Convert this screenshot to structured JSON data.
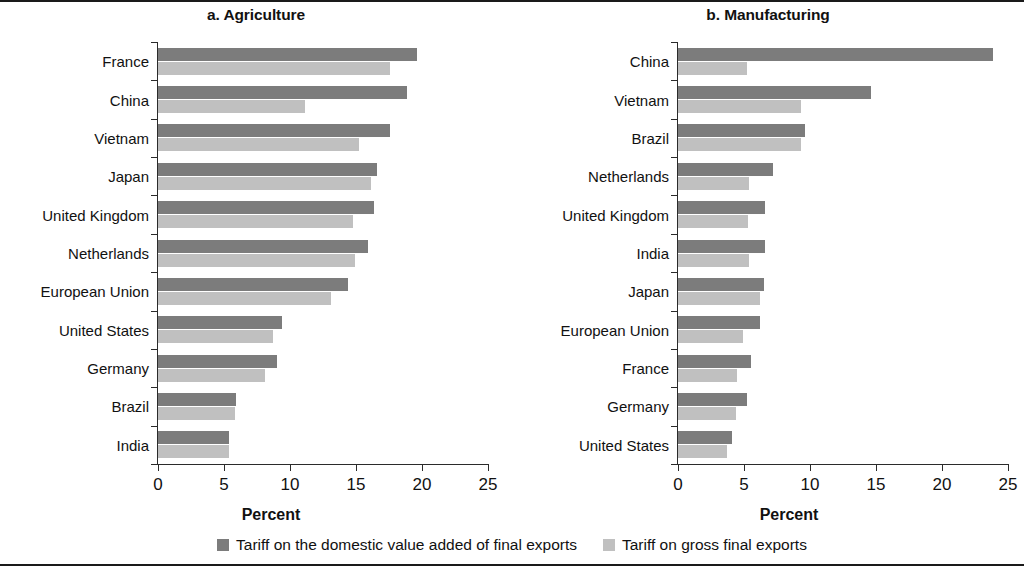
{
  "legend": {
    "items": [
      {
        "label": "Tariff on the domestic value added of final exports",
        "color": "#7c7c7c",
        "key": "dark"
      },
      {
        "label": "Tariff on gross final exports",
        "color": "#c0c0c0",
        "key": "light"
      }
    ]
  },
  "chart_data": [
    {
      "type": "bar",
      "orientation": "horizontal",
      "title": "a. Agriculture",
      "xlabel": "Percent",
      "ylabel": "",
      "xlim": [
        0,
        25
      ],
      "xticks": [
        0,
        5,
        10,
        15,
        20,
        25
      ],
      "grid": false,
      "legend_position": "bottom-center",
      "categories": [
        "France",
        "China",
        "Vietnam",
        "Japan",
        "United Kingdom",
        "Netherlands",
        "European Union",
        "United States",
        "Germany",
        "Brazil",
        "India"
      ],
      "series": [
        {
          "name": "Tariff on the domestic value added of final exports",
          "color": "#7c7c7c",
          "values": [
            19.6,
            18.9,
            17.6,
            16.6,
            16.4,
            15.9,
            14.4,
            9.4,
            9.0,
            5.9,
            5.4
          ]
        },
        {
          "name": "Tariff on gross final exports",
          "color": "#c0c0c0",
          "values": [
            17.6,
            11.1,
            15.2,
            16.1,
            14.8,
            14.9,
            13.1,
            8.7,
            8.1,
            5.8,
            5.4
          ]
        }
      ]
    },
    {
      "type": "bar",
      "orientation": "horizontal",
      "title": "b. Manufacturing",
      "xlabel": "Percent",
      "ylabel": "",
      "xlim": [
        0,
        25
      ],
      "xticks": [
        0,
        5,
        10,
        15,
        20,
        25
      ],
      "grid": false,
      "legend_position": "bottom-center",
      "categories": [
        "China",
        "Vietnam",
        "Brazil",
        "Netherlands",
        "United Kingdom",
        "India",
        "Japan",
        "European Union",
        "France",
        "Germany",
        "United States"
      ],
      "series": [
        {
          "name": "Tariff on the domestic value added of final exports",
          "color": "#7c7c7c",
          "values": [
            23.9,
            14.6,
            9.6,
            7.2,
            6.6,
            6.6,
            6.5,
            6.2,
            5.5,
            5.2,
            4.1
          ]
        },
        {
          "name": "Tariff on gross final exports",
          "color": "#c0c0c0",
          "values": [
            5.2,
            9.3,
            9.3,
            5.4,
            5.3,
            5.4,
            6.2,
            4.9,
            4.5,
            4.4,
            3.7
          ]
        }
      ]
    }
  ]
}
